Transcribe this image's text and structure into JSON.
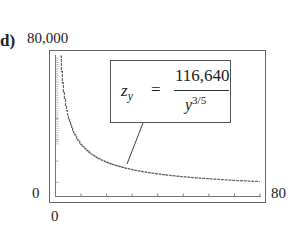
{
  "panel": {
    "label": "d)"
  },
  "axes": {
    "y_max_label": "80,000",
    "y_min_label": "0",
    "x_min_label": "0",
    "x_max_label": "80"
  },
  "equation": {
    "lhs": "z",
    "lhs_sub": "y",
    "equals": "=",
    "numerator": "116,640",
    "denominator_base": "y",
    "denominator_exp": "3/5"
  },
  "chart_data": {
    "type": "line",
    "title": "",
    "xlabel": "",
    "ylabel": "",
    "xlim": [
      0,
      80
    ],
    "ylim": [
      0,
      80000
    ],
    "grid": false,
    "legend": null,
    "formula": "z_y = 116640 / y^(3/5)",
    "annotations": [
      "z_y = 116,640 / y^(3/5)"
    ],
    "x_ticks": [
      0,
      10,
      20,
      30,
      40,
      50,
      60,
      70,
      80
    ],
    "series": [
      {
        "name": "z_y",
        "style": "step",
        "x": [
          2,
          3,
          4,
          5,
          6,
          8,
          10,
          15,
          20,
          25,
          30,
          40,
          50,
          60,
          70,
          80
        ],
        "values": [
          76950,
          60340,
          50730,
          44280,
          39570,
          33500,
          29300,
          22970,
          19340,
          16910,
          15150,
          12760,
          11180,
          10040,
          9180,
          8420
        ]
      }
    ]
  }
}
